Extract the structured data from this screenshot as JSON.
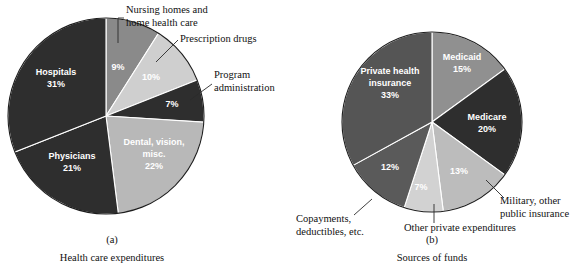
{
  "figure": {
    "background": "#ffffff",
    "text_color": "#111111"
  },
  "chart_data": [
    {
      "type": "pie",
      "id": "health-care-expenditures",
      "title": "Health care expenditures",
      "panel_letter": "(a)",
      "center": [
        106,
        116
      ],
      "radius": 98,
      "start_angle_deg": -90,
      "direction": "clockwise",
      "total": 100,
      "categories": [
        "Nursing homes and home health care",
        "Prescription drugs",
        "Program administration",
        "Dental, vision, misc.",
        "Physicians",
        "Hospitals"
      ],
      "values": [
        9,
        10,
        7,
        22,
        21,
        31
      ],
      "labels": [
        "9%",
        "10%",
        "7%",
        "22%",
        "21%",
        "31%"
      ],
      "colors": [
        "#8a8a8a",
        "#cfcfcf",
        "#2e2e2e",
        "#b8b8b8",
        "#2e2e2e",
        "#2e2e2e"
      ],
      "label_placement": [
        "inside",
        "inside",
        "inside",
        "inside",
        "inside",
        "inside"
      ],
      "inside_labels": [
        {
          "text": "9%",
          "x": 118,
          "y": 68,
          "color": "#ffffff"
        },
        {
          "text": "10%",
          "x": 151,
          "y": 78,
          "color": "#1a1a1a"
        },
        {
          "text": "7%",
          "x": 172,
          "y": 105,
          "color": "#ffffff"
        },
        {
          "text": "Dental, vision,",
          "x": 154,
          "y": 143,
          "color": "#1a1a1a"
        },
        {
          "text": "misc.",
          "x": 154,
          "y": 155,
          "color": "#1a1a1a"
        },
        {
          "text": "22%",
          "x": 154,
          "y": 167,
          "color": "#1a1a1a"
        },
        {
          "text": "Physicians",
          "x": 72,
          "y": 157,
          "color": "#ffffff"
        },
        {
          "text": "21%",
          "x": 72,
          "y": 169,
          "color": "#ffffff"
        },
        {
          "text": "Hospitals",
          "x": 56,
          "y": 73,
          "color": "#ffffff"
        },
        {
          "text": "31%",
          "x": 56,
          "y": 85,
          "color": "#ffffff"
        }
      ],
      "callouts": [
        {
          "name": "nursing-homes-callout",
          "lines": [
            "Nursing homes and",
            "home health care"
          ],
          "text_x": 126,
          "text_y": 13,
          "leader": "M118,43 L118,18 L124,18"
        },
        {
          "name": "prescription-drugs-callout",
          "lines": [
            "Prescription drugs"
          ],
          "text_x": 180,
          "text_y": 42,
          "leader": "M156,62 L178,40"
        },
        {
          "name": "program-administration-callout",
          "lines": [
            "Program",
            "administration"
          ],
          "text_x": 214,
          "text_y": 78,
          "leader": "M190,100 L212,84"
        }
      ],
      "caption_letter_pos": [
        112,
        243
      ],
      "caption_title_pos": [
        112,
        261
      ]
    },
    {
      "type": "pie",
      "id": "sources-of-funds",
      "title": "Sources of funds",
      "panel_letter": "(b)",
      "center": [
        432,
        122
      ],
      "radius": 90,
      "start_angle_deg": -90,
      "direction": "clockwise",
      "total": 100,
      "categories": [
        "Medicaid",
        "Medicare",
        "Military, other public insurance",
        "Other private expenditures",
        "Copayments, deductibles, etc.",
        "Private health insurance"
      ],
      "values": [
        15,
        20,
        13,
        7,
        12,
        33
      ],
      "labels": [
        "15%",
        "20%",
        "13%",
        "7%",
        "12%",
        "33%"
      ],
      "colors": [
        "#909090",
        "#2e2e2e",
        "#bcbcbc",
        "#d2d2d2",
        "#5a5a5a",
        "#555555"
      ],
      "inside_labels": [
        {
          "text": "Medicaid",
          "x": 462,
          "y": 58,
          "color": "#ffffff"
        },
        {
          "text": "15%",
          "x": 462,
          "y": 70,
          "color": "#ffffff"
        },
        {
          "text": "Medicare",
          "x": 487,
          "y": 118,
          "color": "#ffffff"
        },
        {
          "text": "20%",
          "x": 487,
          "y": 130,
          "color": "#ffffff"
        },
        {
          "text": "13%",
          "x": 459,
          "y": 172,
          "color": "#1a1a1a"
        },
        {
          "text": "7%",
          "x": 421,
          "y": 188,
          "color": "#1a1a1a"
        },
        {
          "text": "12%",
          "x": 390,
          "y": 168,
          "color": "#ffffff"
        },
        {
          "text": "Private health",
          "x": 390,
          "y": 72,
          "color": "#ffffff"
        },
        {
          "text": "insurance",
          "x": 390,
          "y": 84,
          "color": "#ffffff"
        },
        {
          "text": "33%",
          "x": 390,
          "y": 96,
          "color": "#ffffff"
        }
      ],
      "callouts": [
        {
          "name": "military-other-public-insurance-callout",
          "lines": [
            "Military, other",
            "public insurance"
          ],
          "text_x": 500,
          "text_y": 204,
          "leader": "M486,180 L504,198"
        },
        {
          "name": "other-private-expenditures-callout",
          "lines": [
            "Other private expenditures"
          ],
          "text_x": 404,
          "text_y": 231,
          "leader": "M434,204 L434,223"
        },
        {
          "name": "copayments-deductibles-callout",
          "lines": [
            "Copayments,",
            "deductibles, etc."
          ],
          "text_x": 296,
          "text_y": 222,
          "leader": "M372,199 L354,215"
        }
      ],
      "caption_letter_pos": [
        432,
        243
      ],
      "caption_title_pos": [
        432,
        261
      ]
    }
  ]
}
